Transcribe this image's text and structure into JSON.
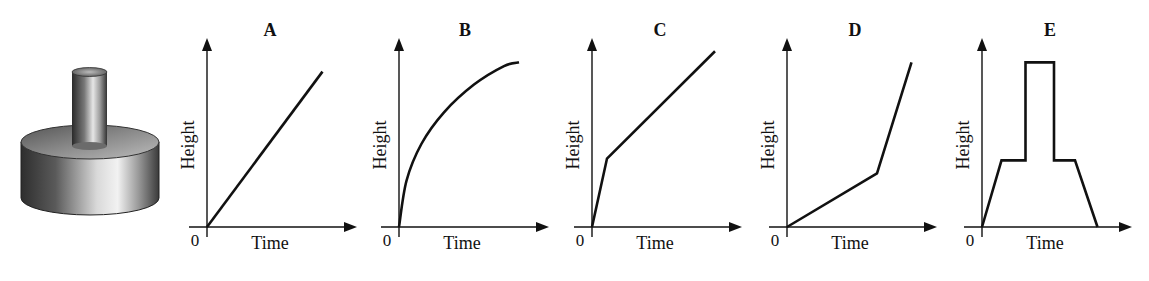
{
  "figure": {
    "object": {
      "name": "container-illustration",
      "description": "Narrow cylinder standing on top of a wide, short cylinder"
    }
  },
  "chart_data": [
    {
      "type": "line",
      "title": "A",
      "xlabel": "Time",
      "ylabel": "Height",
      "origin_label": "0",
      "xlim": [
        0,
        1
      ],
      "ylim": [
        0,
        1
      ],
      "shape": "straight",
      "points": [
        [
          0,
          0
        ],
        [
          0.77,
          0.84
        ]
      ]
    },
    {
      "type": "line",
      "title": "B",
      "xlabel": "Time",
      "ylabel": "Height",
      "origin_label": "0",
      "xlim": [
        0,
        1
      ],
      "ylim": [
        0,
        1
      ],
      "shape": "concave-curve",
      "points": [
        [
          0,
          0
        ],
        [
          0.05,
          0.25
        ],
        [
          0.15,
          0.45
        ],
        [
          0.3,
          0.62
        ],
        [
          0.5,
          0.77
        ],
        [
          0.7,
          0.87
        ],
        [
          0.8,
          0.89
        ]
      ]
    },
    {
      "type": "line",
      "title": "C",
      "xlabel": "Time",
      "ylabel": "Height",
      "origin_label": "0",
      "xlim": [
        0,
        1
      ],
      "ylim": [
        0,
        1
      ],
      "shape": "piecewise-linear",
      "points": [
        [
          0,
          0
        ],
        [
          0.1,
          0.37
        ],
        [
          0.82,
          0.95
        ]
      ]
    },
    {
      "type": "line",
      "title": "D",
      "xlabel": "Time",
      "ylabel": "Height",
      "origin_label": "0",
      "xlim": [
        0,
        1
      ],
      "ylim": [
        0,
        1
      ],
      "shape": "piecewise-linear",
      "points": [
        [
          0,
          0
        ],
        [
          0.6,
          0.29
        ],
        [
          0.83,
          0.89
        ]
      ]
    },
    {
      "type": "line",
      "title": "E",
      "xlabel": "Time",
      "ylabel": "Height",
      "origin_label": "0",
      "xlim": [
        0,
        1
      ],
      "ylim": [
        0,
        1
      ],
      "shape": "piecewise-linear",
      "points": [
        [
          0,
          0
        ],
        [
          0.13,
          0.36
        ],
        [
          0.29,
          0.36
        ],
        [
          0.29,
          0.89
        ],
        [
          0.48,
          0.89
        ],
        [
          0.48,
          0.36
        ],
        [
          0.62,
          0.36
        ],
        [
          0.77,
          0
        ]
      ]
    }
  ]
}
